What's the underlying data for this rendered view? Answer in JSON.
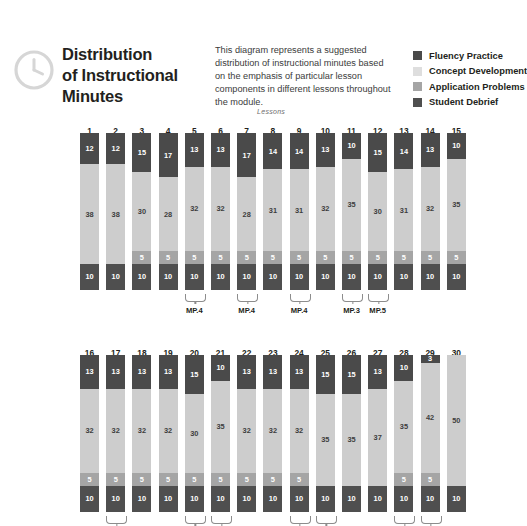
{
  "header": {
    "icon": "clock-icon",
    "title": "Distribution of Instructional Minutes",
    "title_lines": [
      "Distribution",
      "of Instructional",
      "Minutes"
    ],
    "blurb": "This diagram represents a suggested distribution of instructional minutes based on the emphasis of particular lesson components in different lessons throughout the module.",
    "legend": [
      {
        "label": "Fluency Practice",
        "color": "#4a4a4a",
        "key": "fluency"
      },
      {
        "label": "Concept Development",
        "color": "#cdcdcd",
        "key": "concept"
      },
      {
        "label": "Application Problems",
        "color": "#a5a5a5",
        "key": "app"
      },
      {
        "label": "Student Debrief",
        "color": "#4f4f4f",
        "key": "debrief"
      }
    ]
  },
  "chart_data": {
    "type": "bar",
    "subtype": "stacked",
    "title": "Distribution of Instructional Minutes",
    "xlabel": "Lessons",
    "ylabel": "Minutes",
    "ylim": [
      0,
      60
    ],
    "grid": false,
    "legend_position": "top-right",
    "series": [
      {
        "name": "Fluency Practice",
        "key": "fluency",
        "color": "#4a4a4a",
        "values": [
          12,
          12,
          15,
          17,
          13,
          13,
          17,
          14,
          14,
          13,
          10,
          15,
          14,
          13,
          10,
          13,
          13,
          13,
          13,
          15,
          10,
          13,
          13,
          13,
          15,
          15,
          13,
          10,
          3,
          0
        ]
      },
      {
        "name": "Concept Development",
        "key": "concept",
        "color": "#cdcdcd",
        "values": [
          38,
          38,
          30,
          28,
          32,
          32,
          28,
          31,
          31,
          32,
          35,
          30,
          31,
          32,
          35,
          32,
          32,
          32,
          32,
          30,
          35,
          32,
          32,
          32,
          35,
          35,
          37,
          35,
          42,
          50
        ]
      },
      {
        "name": "Application Problems",
        "key": "app",
        "color": "#a5a5a5",
        "values": [
          0,
          0,
          5,
          5,
          5,
          5,
          5,
          5,
          5,
          5,
          5,
          5,
          5,
          5,
          5,
          5,
          5,
          5,
          5,
          5,
          5,
          5,
          5,
          5,
          0,
          0,
          0,
          5,
          5,
          0
        ]
      },
      {
        "name": "Student Debrief",
        "key": "debrief",
        "color": "#4f4f4f",
        "values": [
          10,
          10,
          10,
          10,
          10,
          10,
          10,
          10,
          10,
          10,
          10,
          10,
          10,
          10,
          10,
          10,
          10,
          10,
          10,
          10,
          10,
          10,
          10,
          10,
          10,
          10,
          10,
          10,
          10,
          10
        ]
      }
    ],
    "rows": [
      {
        "axis_label": "Lessons",
        "categories": [
          "1",
          "2",
          "3",
          "4",
          "5",
          "6",
          "7",
          "8",
          "9",
          "10",
          "11",
          "12",
          "13",
          "14",
          "15"
        ],
        "brackets": [
          {
            "lesson": "5",
            "label": "MP.4"
          },
          {
            "lesson": "7",
            "label": "MP.4"
          },
          {
            "lesson": "9",
            "label": "MP.4"
          },
          {
            "lesson": "11",
            "label": "MP.3"
          },
          {
            "lesson": "12",
            "label": "MP.5"
          }
        ]
      },
      {
        "axis_label": "",
        "categories": [
          "16",
          "17",
          "18",
          "19",
          "20",
          "21",
          "22",
          "23",
          "24",
          "25",
          "26",
          "27",
          "28",
          "29",
          "30"
        ],
        "brackets": [
          {
            "lesson": "17",
            "label": ""
          },
          {
            "lesson": "20",
            "label": ""
          },
          {
            "lesson": "21",
            "label": ""
          },
          {
            "lesson": "24",
            "label": ""
          },
          {
            "lesson": "25",
            "label": ""
          },
          {
            "lesson": "28",
            "label": ""
          },
          {
            "lesson": "29",
            "label": ""
          }
        ]
      }
    ]
  }
}
